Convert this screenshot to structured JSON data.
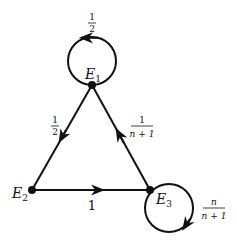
{
  "diagram": {
    "type": "state-transition-graph",
    "nodes": [
      {
        "id": "E1",
        "label": "E",
        "subscript": "1"
      },
      {
        "id": "E2",
        "label": "E",
        "subscript": "2"
      },
      {
        "id": "E3",
        "label": "E",
        "subscript": "3"
      }
    ],
    "edges": [
      {
        "from": "E1",
        "to": "E1",
        "label_num": "1",
        "label_den": "2"
      },
      {
        "from": "E1",
        "to": "E2",
        "label_num": "1",
        "label_den": "2"
      },
      {
        "from": "E2",
        "to": "E3",
        "label": "1"
      },
      {
        "from": "E3",
        "to": "E1",
        "label_num": "1",
        "label_den": "n + 1"
      },
      {
        "from": "E3",
        "to": "E3",
        "label_num": "n",
        "label_den": "n + 1"
      }
    ],
    "colors": {
      "stroke": "#111111",
      "background": "#ffffff"
    }
  }
}
